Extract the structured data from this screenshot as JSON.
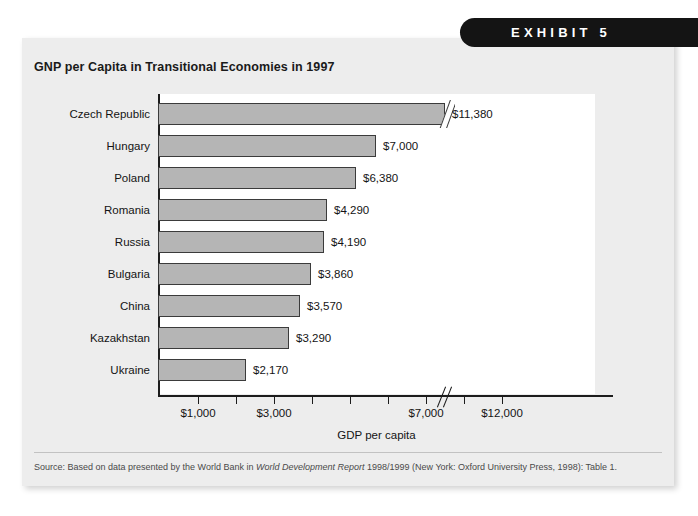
{
  "badge": {
    "label": "EXHIBIT 5"
  },
  "card": {
    "title": "GNP per Capita in Transitional Economies in 1997",
    "source_prefix": "Source: Based on data presented by the World Bank in ",
    "source_italic": "World Development Report",
    "source_suffix": " 1998/1999 (New York: Oxford University Press, 1998): Table 1."
  },
  "chart_data": {
    "type": "bar",
    "orientation": "horizontal",
    "title": "GNP per Capita in Transitional Economies in 1997",
    "xlabel": "GDP per capita",
    "ylabel": "",
    "categories": [
      "Czech Republic",
      "Hungary",
      "Poland",
      "Romania",
      "Russia",
      "Bulgaria",
      "China",
      "Kazakhstan",
      "Ukraine"
    ],
    "values": [
      11380,
      7000,
      6380,
      4290,
      4190,
      3860,
      3570,
      3290,
      2170
    ],
    "value_labels": [
      "$11,380",
      "$7,000",
      "$6,380",
      "$4,290",
      "$4,190",
      "$3,860",
      "$3,570",
      "$3,290",
      "$2,170"
    ],
    "bar_pixel_widths": [
      287,
      218,
      198,
      169,
      166,
      153,
      142,
      131,
      88
    ],
    "bar_has_break": [
      true,
      false,
      false,
      false,
      false,
      false,
      false,
      false,
      false
    ],
    "xtick_labels": [
      "$1,000",
      "$3,000",
      "$7,000",
      "$12,000"
    ],
    "xtick_positions_px": [
      40,
      116,
      268,
      344
    ],
    "xtick_minor_positions_px": [
      40,
      78,
      116,
      154,
      192,
      230,
      268,
      306,
      344
    ],
    "axis_break_position_px": 287,
    "grid": false,
    "legend": false,
    "bar_color": "#b5b5b5",
    "bar_border_color": "#3b3b3b",
    "plot_background": "#ffffff",
    "card_background": "#ededed",
    "badge_color": "#141414"
  }
}
